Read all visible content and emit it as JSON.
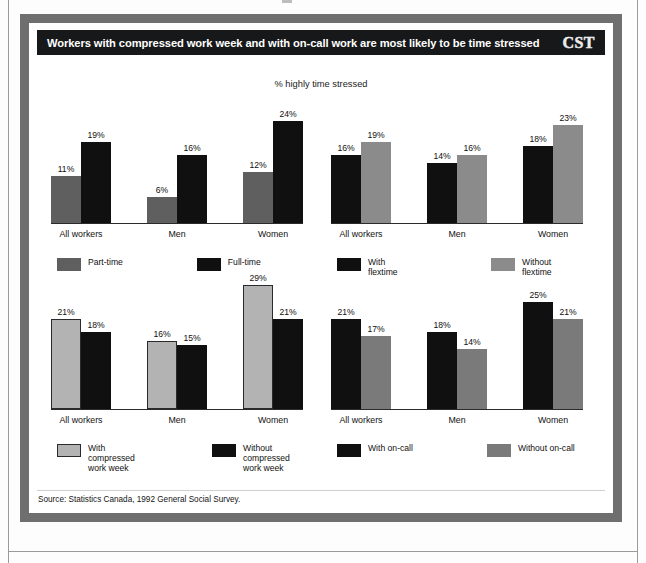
{
  "header": {
    "title": "Workers with compressed work week and with on-call work are most likely to be time stressed",
    "logo": "CST"
  },
  "subtitle": "% highly time stressed",
  "source": "Source: Statistics Canada, 1992 General Social Survey.",
  "colors": {
    "frame": "#6f6f6f",
    "title_bar": "#17181a",
    "black_series": "#101010",
    "gray_dark_series": "#5f5f5f",
    "gray_medium_series": "#8b8b8b",
    "gray_mid_series": "#7a7a7a",
    "gray_light_series": "#b3b3b3"
  },
  "chart_data": [
    {
      "type": "bar",
      "id": "part-time-full-time",
      "title": "",
      "xlabel": "",
      "ylabel": "% highly time stressed",
      "ylim": [
        0,
        30
      ],
      "grid": false,
      "legend_position": "bottom-left",
      "categories": [
        "All workers",
        "Men",
        "Women"
      ],
      "series": [
        {
          "name": "Part-time",
          "color": "#5f5f5f",
          "values": [
            11,
            6,
            12
          ],
          "labels": [
            "11%",
            "6%",
            "12%"
          ]
        },
        {
          "name": "Full-time",
          "color": "#101010",
          "values": [
            19,
            16,
            24
          ],
          "labels": [
            "19%",
            "16%",
            "24%"
          ]
        }
      ]
    },
    {
      "type": "bar",
      "id": "flextime",
      "title": "",
      "xlabel": "",
      "ylabel": "% highly time stressed",
      "ylim": [
        0,
        30
      ],
      "grid": false,
      "legend_position": "bottom-left",
      "categories": [
        "All workers",
        "Men",
        "Women"
      ],
      "series": [
        {
          "name": "With flextime",
          "color": "#101010",
          "values": [
            16,
            14,
            18
          ],
          "labels": [
            "16%",
            "14%",
            "18%"
          ]
        },
        {
          "name": "Without flextime",
          "color": "#8b8b8b",
          "values": [
            19,
            16,
            23
          ],
          "labels": [
            "19%",
            "16%",
            "23%"
          ]
        }
      ]
    },
    {
      "type": "bar",
      "id": "compressed-work-week",
      "title": "",
      "xlabel": "",
      "ylabel": "% highly time stressed",
      "ylim": [
        0,
        30
      ],
      "grid": false,
      "legend_position": "bottom-left",
      "categories": [
        "All workers",
        "Men",
        "Women"
      ],
      "series": [
        {
          "name": "With compressed\nwork week",
          "color": "#b3b3b3",
          "values": [
            21,
            16,
            29
          ],
          "labels": [
            "21%",
            "16%",
            "29%"
          ]
        },
        {
          "name": "Without compressed\nwork week",
          "color": "#101010",
          "values": [
            18,
            15,
            21
          ],
          "labels": [
            "18%",
            "15%",
            "21%"
          ]
        }
      ]
    },
    {
      "type": "bar",
      "id": "on-call",
      "title": "",
      "xlabel": "",
      "ylabel": "% highly time stressed",
      "ylim": [
        0,
        30
      ],
      "grid": false,
      "legend_position": "bottom-left",
      "categories": [
        "All workers",
        "Men",
        "Women"
      ],
      "series": [
        {
          "name": "With on-call",
          "color": "#101010",
          "values": [
            21,
            18,
            25
          ],
          "labels": [
            "21%",
            "18%",
            "25%"
          ]
        },
        {
          "name": "Without on-call",
          "color": "#7a7a7a",
          "values": [
            17,
            14,
            21
          ],
          "labels": [
            "17%",
            "14%",
            "21%"
          ]
        }
      ]
    }
  ]
}
